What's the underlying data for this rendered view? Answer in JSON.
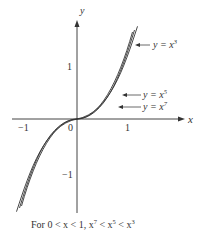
{
  "diagram": {
    "axes": {
      "x_label": "x",
      "y_label": "y",
      "origin_label": "0",
      "x_ticks": [
        "−1",
        "1"
      ],
      "y_ticks": [
        "1",
        "−1"
      ]
    },
    "curves": [
      {
        "label_prefix": "y = x",
        "exponent": "3"
      },
      {
        "label_prefix": "y = x",
        "exponent": "5"
      },
      {
        "label_prefix": "y = x",
        "exponent": "7"
      }
    ],
    "caption": {
      "text": "For 0 < x < 1, x",
      "exp7": "7",
      "mid1": " < x",
      "exp5": "5",
      "mid2": " < x",
      "exp3": "3"
    },
    "colors": {
      "stroke": "#333333",
      "background": "#ffffff"
    }
  }
}
